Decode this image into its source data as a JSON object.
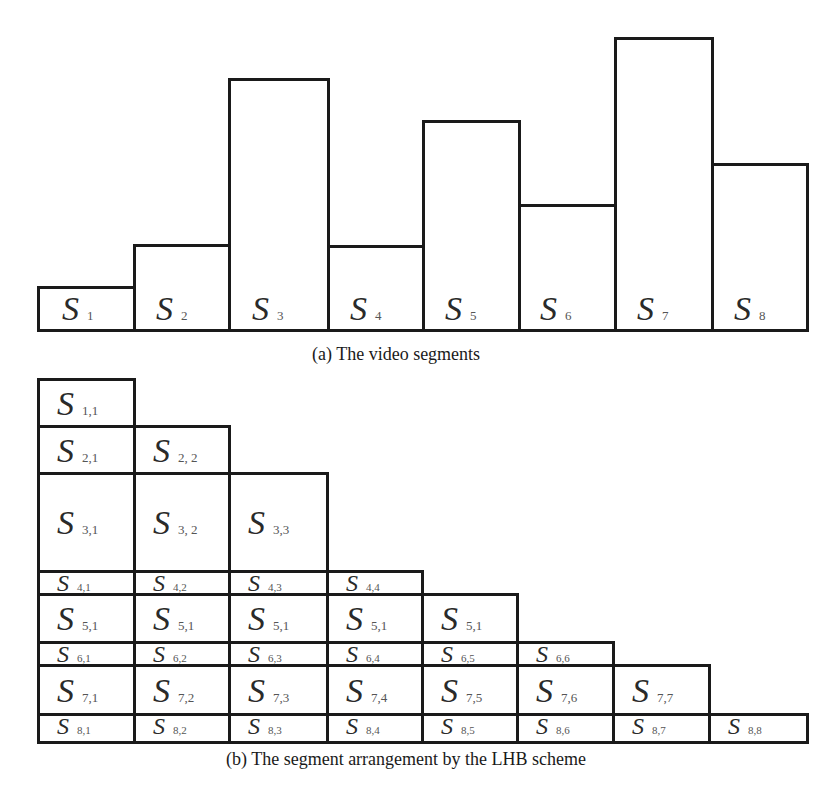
{
  "figure_a": {
    "caption": "(a) The video segments",
    "segments": [
      {
        "symbol": "S",
        "sub": "1"
      },
      {
        "symbol": "S",
        "sub": "2"
      },
      {
        "symbol": "S",
        "sub": "3"
      },
      {
        "symbol": "S",
        "sub": "4"
      },
      {
        "symbol": "S",
        "sub": "5"
      },
      {
        "symbol": "S",
        "sub": "6"
      },
      {
        "symbol": "S",
        "sub": "7"
      },
      {
        "symbol": "S",
        "sub": "8"
      }
    ]
  },
  "figure_b": {
    "caption": "(b) The segment arrangement by the LHB scheme",
    "rows": [
      [
        {
          "symbol": "S",
          "sub": "1,1"
        }
      ],
      [
        {
          "symbol": "S",
          "sub": "2,1"
        },
        {
          "symbol": "S",
          "sub": "2, 2"
        }
      ],
      [
        {
          "symbol": "S",
          "sub": "3,1"
        },
        {
          "symbol": "S",
          "sub": "3, 2"
        },
        {
          "symbol": "S",
          "sub": "3,3"
        }
      ],
      [
        {
          "symbol": "S",
          "sub": "4,1"
        },
        {
          "symbol": "S",
          "sub": "4,2"
        },
        {
          "symbol": "S",
          "sub": "4,3"
        },
        {
          "symbol": "S",
          "sub": "4,4"
        }
      ],
      [
        {
          "symbol": "S",
          "sub": "5,1"
        },
        {
          "symbol": "S",
          "sub": "5,1"
        },
        {
          "symbol": "S",
          "sub": "5,1"
        },
        {
          "symbol": "S",
          "sub": "5,1"
        },
        {
          "symbol": "S",
          "sub": "5,1"
        }
      ],
      [
        {
          "symbol": "S",
          "sub": "6,1"
        },
        {
          "symbol": "S",
          "sub": "6,2"
        },
        {
          "symbol": "S",
          "sub": "6,3"
        },
        {
          "symbol": "S",
          "sub": "6,4"
        },
        {
          "symbol": "S",
          "sub": "6,5"
        },
        {
          "symbol": "S",
          "sub": "6,6"
        }
      ],
      [
        {
          "symbol": "S",
          "sub": "7,1"
        },
        {
          "symbol": "S",
          "sub": "7,2"
        },
        {
          "symbol": "S",
          "sub": "7,3"
        },
        {
          "symbol": "S",
          "sub": "7,4"
        },
        {
          "symbol": "S",
          "sub": "7,5"
        },
        {
          "symbol": "S",
          "sub": "7,6"
        },
        {
          "symbol": "S",
          "sub": "7,7"
        }
      ],
      [
        {
          "symbol": "S",
          "sub": "8,1"
        },
        {
          "symbol": "S",
          "sub": "8,2"
        },
        {
          "symbol": "S",
          "sub": "8,3"
        },
        {
          "symbol": "S",
          "sub": "8,4"
        },
        {
          "symbol": "S",
          "sub": "8,5"
        },
        {
          "symbol": "S",
          "sub": "8,6"
        },
        {
          "symbol": "S",
          "sub": "8,7"
        },
        {
          "symbol": "S",
          "sub": "8,8"
        }
      ]
    ]
  }
}
